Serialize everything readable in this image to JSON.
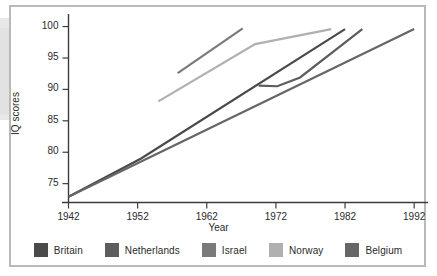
{
  "chart_data": {
    "type": "line",
    "title": "",
    "xlabel": "Year",
    "ylabel": "IQ scores",
    "xlim": [
      1942,
      1994
    ],
    "ylim": [
      72,
      102
    ],
    "grid": false,
    "legend_position": "bottom",
    "xticks": [
      1942,
      1952,
      1962,
      1972,
      1982,
      1992
    ],
    "yticks": [
      75,
      80,
      85,
      90,
      95,
      100
    ],
    "series": [
      {
        "name": "Britain",
        "color": "#4a4a4a",
        "points": [
          [
            1942,
            72.9
          ],
          [
            1952.5,
            79.0
          ],
          [
            1982,
            99.6
          ]
        ]
      },
      {
        "name": "Netherlands",
        "color": "#5d5d5d",
        "points": [
          [
            1969.5,
            90.6
          ],
          [
            1972.2,
            90.5
          ],
          [
            1975.5,
            91.9
          ],
          [
            1984.5,
            99.6
          ]
        ]
      },
      {
        "name": "Israel",
        "color": "#7a7a7a",
        "points": [
          [
            1957.8,
            92.6
          ],
          [
            1967.2,
            99.7
          ]
        ]
      },
      {
        "name": "Norway",
        "color": "#b0b0b0",
        "points": [
          [
            1955.0,
            88.1
          ],
          [
            1969.0,
            97.2
          ],
          [
            1980.0,
            99.6
          ]
        ]
      },
      {
        "name": "Belgium",
        "color": "#666666",
        "points": [
          [
            1942,
            72.9
          ],
          [
            1992,
            99.6
          ]
        ]
      }
    ]
  },
  "legend": {
    "items": [
      {
        "label": "Britain"
      },
      {
        "label": "Netherlands"
      },
      {
        "label": "Israel"
      },
      {
        "label": "Norway"
      },
      {
        "label": "Belgium"
      }
    ]
  },
  "axes": {
    "x_title": "Year",
    "y_title": "IQ scores",
    "x_tick_labels": [
      "1942",
      "1952",
      "1962",
      "1972",
      "1982",
      "1992"
    ],
    "y_tick_labels": [
      "75",
      "80",
      "85",
      "90",
      "95",
      "100"
    ]
  },
  "colors": {
    "axis": "#3c3c3c",
    "frame": "#b9b9b9",
    "text": "#2b2b2b",
    "background": "#ffffff"
  }
}
